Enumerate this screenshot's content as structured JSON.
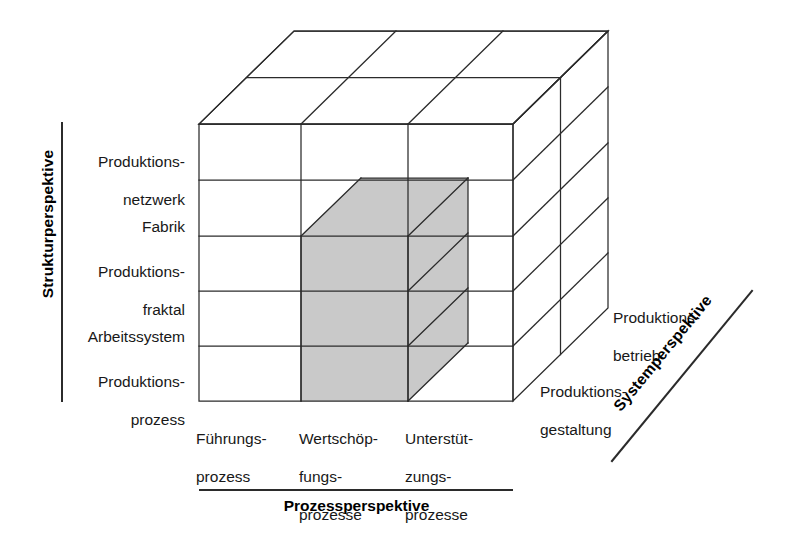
{
  "figure": {
    "type": "3d-matrix-cube-diagram",
    "grid": {
      "columns": 3,
      "rows": 5,
      "depth_layers": 2
    },
    "shaded_color": "#c9c9c9",
    "line_color": "#2b2b2b",
    "background": "#ffffff"
  },
  "axes": {
    "vertical": {
      "title": "Strukturperspektive",
      "orientation": "vertical-rotated"
    },
    "horizontal": {
      "title": "Prozessperspektive",
      "orientation": "horizontal"
    },
    "depth": {
      "title": "Systemperspektive",
      "orientation": "diagonal"
    }
  },
  "structure_levels": [
    {
      "line1": "Produktions-",
      "line2": "netzwerk"
    },
    {
      "line1": "Fabrik",
      "line2": ""
    },
    {
      "line1": "Produktions-",
      "line2": "fraktal"
    },
    {
      "line1": "Arbeitssystem",
      "line2": ""
    },
    {
      "line1": "Produktions-",
      "line2": "prozess"
    }
  ],
  "process_levels": [
    {
      "line1": "Führungs-",
      "line2": "prozess",
      "line3": ""
    },
    {
      "line1": "Wertschöp-",
      "line2": "fungs-",
      "line3": "prozesse"
    },
    {
      "line1": "Unterstüt-",
      "line2": "zungs-",
      "line3": "prozesse"
    }
  ],
  "system_levels": [
    {
      "line1": "Produktions-",
      "line2": "betrieb"
    },
    {
      "line1": "Produktions-",
      "line2": "gestaltung"
    }
  ],
  "highlight": {
    "description": "shaded block spanning Wertschöpfungsprozesse column, rows Produktionsfraktal to Produktionsprozess, extending one depth layer"
  }
}
